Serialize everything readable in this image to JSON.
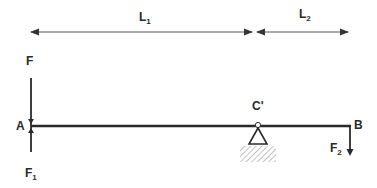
{
  "diagram": {
    "type": "beam free-body diagram",
    "dimensions": {
      "L1": {
        "label": "L",
        "sub": "1"
      },
      "L2": {
        "label": "L",
        "sub": "2"
      }
    },
    "points": {
      "A": "A",
      "B": "B",
      "C": "C'"
    },
    "forces": {
      "F": "F",
      "F1": {
        "label": "F",
        "sub": "1"
      },
      "F2": {
        "label": "F",
        "sub": "2"
      }
    },
    "colors": {
      "line": "#2a2a2a",
      "dimension": "#555555",
      "hatch": "#999999"
    }
  }
}
